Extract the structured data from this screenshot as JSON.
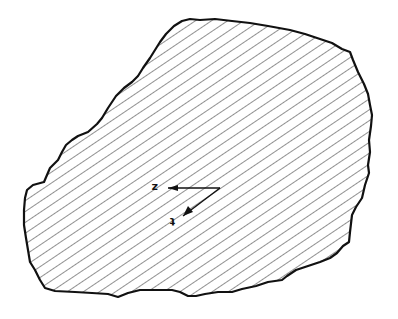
{
  "figure": {
    "type": "hatched-region-with-axes",
    "background": "#ffffff",
    "outline_color": "#111111",
    "hatch_color": "#555555",
    "hatch_angle_deg": -34,
    "hatch_spacing_px": 9
  },
  "axes": {
    "origin": [
      220,
      188
    ],
    "z_axis": {
      "label": "z",
      "end": [
        168,
        188
      ],
      "direction": "left"
    },
    "t_axis": {
      "label": "t",
      "end": [
        183,
        215
      ],
      "direction": "down-left"
    }
  },
  "labels": {
    "z": "z",
    "t": "t"
  }
}
